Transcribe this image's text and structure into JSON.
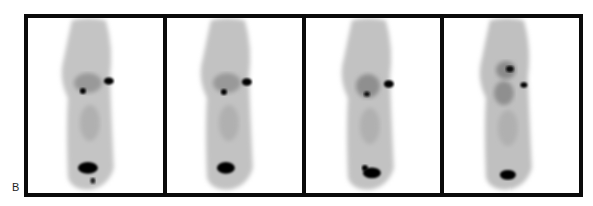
{
  "figure": {
    "panel_label": "B",
    "panel_count": 4,
    "panels": [
      {
        "index": 1,
        "hotspots": [
          "upper-right-focus",
          "upper-left-focus",
          "bladder"
        ]
      },
      {
        "index": 2,
        "hotspots": [
          "upper-right-focus",
          "upper-left-focus",
          "bladder"
        ]
      },
      {
        "index": 3,
        "hotspots": [
          "upper-right-focus",
          "upper-left-focus",
          "bladder"
        ]
      },
      {
        "index": 4,
        "hotspots": [
          "upper-focus",
          "mid-right-focus",
          "bladder"
        ]
      }
    ],
    "colors": {
      "border": "#0a0a0a",
      "background": "#ffffff",
      "uptake": "#000000",
      "body": "#b8b8b8"
    }
  }
}
